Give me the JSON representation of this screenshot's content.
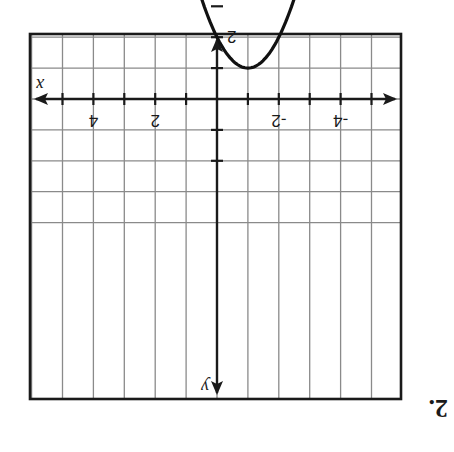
{
  "problem": {
    "number_label": "2."
  },
  "orientation": {
    "rotation_deg": 180
  },
  "chart_data": {
    "type": "line",
    "title": "",
    "xlabel": "x",
    "ylabel": "y",
    "equation": "y = -(x + 1)^2 - 1",
    "vertex": [
      -1,
      -1
    ],
    "y_intercept": [
      0,
      -2
    ],
    "xlim": [
      -5.5,
      6.5
    ],
    "ylim": [
      -9.5,
      2.5
    ],
    "x_tick_labels": [
      "-4",
      "-2",
      "2",
      "4"
    ],
    "x_tick_values": [
      -4,
      -2,
      2,
      4
    ],
    "y_tick_labels": [
      "2",
      "4",
      "6",
      "8"
    ],
    "y_tick_values_as_printed": [
      2,
      4,
      6,
      8
    ],
    "grid": true,
    "grid_step": 1,
    "series": [
      {
        "name": "parabola",
        "x": [
          -4,
          -3.5,
          -3,
          -2.5,
          -2,
          -1.5,
          -1,
          -0.5,
          0,
          0.5,
          1,
          1.5,
          2
        ],
        "y": [
          -10,
          -7.25,
          -5,
          -3.25,
          -2,
          -1.25,
          -1,
          -1.25,
          -2,
          -3.25,
          -5,
          -7.25,
          -10
        ]
      }
    ],
    "arrows_on_ends": true,
    "legend": null,
    "note": "Image is printed upside down (rotated 180°)."
  },
  "colors": {
    "grid": "#8a8a8a",
    "ink": "#1a1a1a",
    "background": "#ffffff"
  }
}
